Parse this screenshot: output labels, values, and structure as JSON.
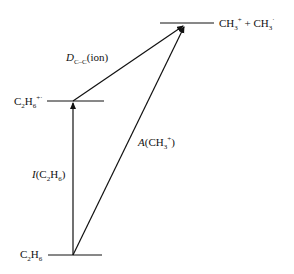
{
  "diagram": {
    "type": "energy-level diagram",
    "levels": [
      {
        "id": "products",
        "label_main": "CH",
        "label_sub": "3",
        "label_sup": "+",
        "label_plus": " + CH",
        "label_sub2": "3",
        "label_sup2": "·"
      },
      {
        "id": "ion",
        "label_main": "C",
        "label_sub": "2",
        "label_mid": "H",
        "label_sub2": "6",
        "label_sup": "+·"
      },
      {
        "id": "neutral",
        "label_main": "C",
        "label_sub": "2",
        "label_mid": "H",
        "label_sub2": "6"
      }
    ],
    "arrows": [
      {
        "id": "ionization",
        "label_italic": "I",
        "label_open": "(C",
        "label_sub": "2",
        "label_mid": "H",
        "label_sub2": "6",
        "label_close": ")"
      },
      {
        "id": "dissociation",
        "label_italic": "D",
        "label_sub": "C–C",
        "label_rest": "(ion)"
      },
      {
        "id": "appearance",
        "label_italic": "A",
        "label_open": "(CH",
        "label_sub": "3",
        "label_sup": "+",
        "label_close": ")"
      }
    ]
  }
}
